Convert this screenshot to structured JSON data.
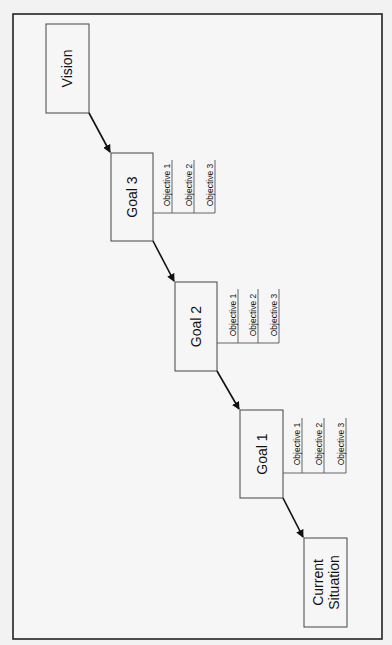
{
  "diagram": {
    "type": "goal-hierarchy",
    "orientation": "rotated-90-ccw",
    "nodes": {
      "vision": {
        "label": "Vision"
      },
      "goal3": {
        "label": "Goal 3",
        "objectives": [
          "Objective 1",
          "Objective 2",
          "Objective 3"
        ]
      },
      "goal2": {
        "label": "Goal 2",
        "objectives": [
          "Objective 1",
          "Objective 2",
          "Objective 3"
        ]
      },
      "goal1": {
        "label": "Goal 1",
        "objectives": [
          "Objective 1",
          "Objective 2",
          "Objective 3"
        ]
      },
      "current": {
        "label_line1": "Current",
        "label_line2": "Situation"
      }
    },
    "edges": [
      {
        "from": "vision",
        "to": "goal3"
      },
      {
        "from": "goal3",
        "to": "goal2"
      },
      {
        "from": "goal2",
        "to": "goal1"
      },
      {
        "from": "goal1",
        "to": "current"
      }
    ]
  }
}
